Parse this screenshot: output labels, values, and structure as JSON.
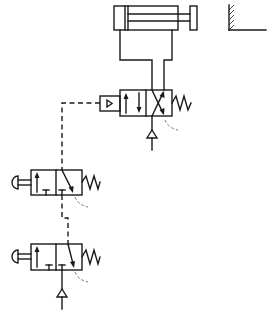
{
  "diagram": {
    "type": "pneumatic-circuit",
    "components": [
      {
        "id": "cylinder",
        "kind": "double-acting-cylinder"
      },
      {
        "id": "wall-stop",
        "kind": "fixed-wall"
      },
      {
        "id": "main-valve",
        "kind": "pilot-operated-valve-spring-return",
        "positions": 2
      },
      {
        "id": "pushbutton-valve-1",
        "kind": "pushbutton-3-2-valve-spring-return"
      },
      {
        "id": "pushbutton-valve-2",
        "kind": "pushbutton-3-2-valve-spring-return"
      },
      {
        "id": "supply-main",
        "kind": "pressure-source"
      },
      {
        "id": "supply-signal",
        "kind": "pressure-source"
      }
    ],
    "connections": [
      {
        "from": "main-valve",
        "to": "cylinder",
        "style": "solid"
      },
      {
        "from": "pushbutton-valve-1",
        "to": "main-valve",
        "style": "dashed-pilot"
      },
      {
        "from": "pushbutton-valve-2",
        "to": "pushbutton-valve-1",
        "style": "dashed-pilot"
      },
      {
        "from": "supply-main",
        "to": "main-valve",
        "style": "solid"
      },
      {
        "from": "supply-signal",
        "to": "pushbutton-valve-2",
        "style": "solid"
      }
    ]
  }
}
